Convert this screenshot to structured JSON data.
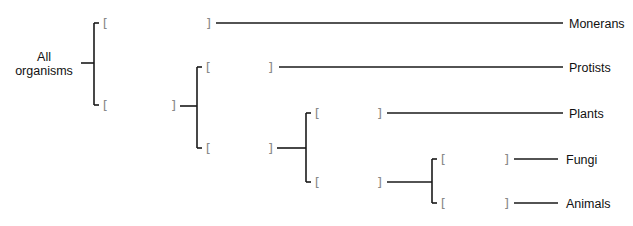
{
  "diagram": {
    "type": "cladogram",
    "root": {
      "label_line1": "All",
      "label_line2": "organisms"
    },
    "bracket_open": "[",
    "bracket_close": "]",
    "leaves": [
      {
        "label": "Monerans"
      },
      {
        "label": "Protists"
      },
      {
        "label": "Plants"
      },
      {
        "label": "Fungi"
      },
      {
        "label": "Animals"
      }
    ],
    "colors": {
      "line": "#1a1a1a",
      "text": "#111111",
      "bracket": "#888888",
      "background": "#ffffff"
    }
  }
}
